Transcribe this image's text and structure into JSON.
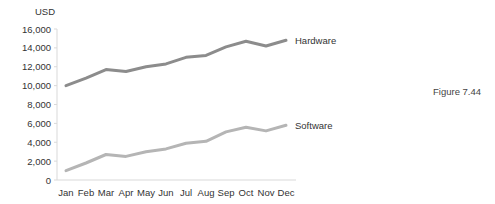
{
  "chart_data": {
    "type": "line",
    "title": "",
    "xlabel": "",
    "ylabel": "USD",
    "ylim": [
      0,
      16000
    ],
    "yticks": [
      0,
      2000,
      4000,
      6000,
      8000,
      10000,
      12000,
      14000,
      16000
    ],
    "ytick_labels": [
      "0",
      "2,000",
      "4,000",
      "6,000",
      "8,000",
      "10,000",
      "12,000",
      "14,000",
      "16,000"
    ],
    "grid": false,
    "legend_position": "inline-right",
    "categories": [
      "Jan",
      "Feb",
      "Mar",
      "Apr",
      "May",
      "Jun",
      "Jul",
      "Aug",
      "Sep",
      "Oct",
      "Nov",
      "Dec"
    ],
    "series": [
      {
        "name": "Hardware",
        "color": "#8c8c8c",
        "values": [
          10000,
          10800,
          11700,
          11500,
          12000,
          12300,
          13000,
          13200,
          14100,
          14700,
          14200,
          14800
        ]
      },
      {
        "name": "Software",
        "color": "#b5b5b5",
        "values": [
          1000,
          1800,
          2700,
          2500,
          3000,
          3300,
          3900,
          4100,
          5100,
          5600,
          5200,
          5800
        ]
      }
    ]
  },
  "caption": "Figure 7.44"
}
